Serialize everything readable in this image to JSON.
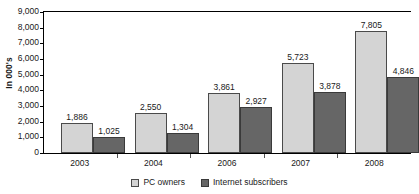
{
  "chart_data": {
    "type": "bar",
    "title": "",
    "subtitle": "",
    "xlabel": "",
    "ylabel": "In 000's",
    "categories": [
      "2003",
      "2004",
      "2006",
      "2007",
      "2008"
    ],
    "series": [
      {
        "name": "PC owners",
        "color": "#d4d4d4",
        "values": [
          1886,
          2550,
          3861,
          5723,
          7805
        ],
        "labels": [
          "1,886",
          "2,550",
          "3,861",
          "5,723",
          "7,805"
        ]
      },
      {
        "name": "Internet subscribers",
        "color": "#666666",
        "values": [
          1025,
          1304,
          2927,
          3878,
          4846
        ],
        "labels": [
          "1,025",
          "1,304",
          "2,927",
          "3,878",
          "4,846"
        ]
      }
    ],
    "ylim": [
      0,
      9000
    ],
    "ytick_values": [
      0,
      1000,
      2000,
      3000,
      4000,
      5000,
      6000,
      7000,
      8000,
      9000
    ],
    "ytick_labels": [
      "0",
      "1,000",
      "2,000",
      "3,000",
      "4,000",
      "5,000",
      "6,000",
      "7,000",
      "8,000",
      "9,000"
    ],
    "grid": false,
    "legend_position": "bottom-center",
    "data_labels": true
  },
  "legend": {
    "items": [
      {
        "label": "PC owners",
        "swatch": "legend-swatch-pc-owners"
      },
      {
        "label": "Internet subscribers",
        "swatch": "legend-swatch-internet-subscribers"
      }
    ]
  }
}
